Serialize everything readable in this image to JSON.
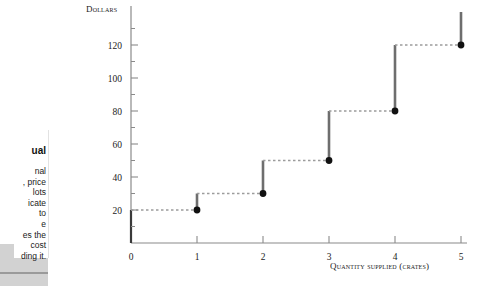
{
  "sidebar": {
    "heading": "ual",
    "lines": [
      "nal",
      ", price",
      "lots",
      "icate",
      "to",
      "e",
      "es the",
      "cost",
      "ding it."
    ]
  },
  "chart_data": {
    "type": "line",
    "title": "",
    "subtitle": "",
    "ylabel": "Dollars",
    "xlabel": "Quantity supplied (crates)",
    "xlim": [
      0,
      5
    ],
    "ylim": [
      0,
      140
    ],
    "grid": false,
    "legend": null,
    "x_ticks": [
      "0",
      "1",
      "2",
      "3",
      "4",
      "5"
    ],
    "x_tick_values": [
      0,
      1,
      2,
      3,
      4,
      5
    ],
    "y_ticks": [
      "20",
      "40",
      "60",
      "80",
      "100",
      "120"
    ],
    "y_tick_values": [
      20,
      40,
      60,
      80,
      100,
      120
    ],
    "y_minor_ticks": [
      10,
      30,
      50,
      70,
      90,
      110,
      130
    ],
    "x": [
      1,
      2,
      3,
      4,
      5
    ],
    "values": [
      20,
      30,
      50,
      80,
      120
    ],
    "series": [
      {
        "name": "Marginal cost / supply",
        "points": [
          {
            "x": 1,
            "y": 20
          },
          {
            "x": 2,
            "y": 30
          },
          {
            "x": 3,
            "y": 50
          },
          {
            "x": 4,
            "y": 80
          },
          {
            "x": 5,
            "y": 120
          }
        ]
      }
    ],
    "steps": [
      {
        "x": 1,
        "dash_from_x": 0,
        "dash_y": 20,
        "riser_top": 30,
        "riser_bottom": 20,
        "dot_y": 20
      },
      {
        "x": 2,
        "dash_from_x": 1,
        "dash_y": 30,
        "riser_top": 50,
        "riser_bottom": 30,
        "dot_y": 30
      },
      {
        "x": 3,
        "dash_from_x": 2,
        "dash_y": 50,
        "riser_top": 80,
        "riser_bottom": 50,
        "dot_y": 50
      },
      {
        "x": 4,
        "dash_from_x": 3,
        "dash_y": 80,
        "riser_top": 120,
        "riser_bottom": 80,
        "dot_y": 80
      },
      {
        "x": 5,
        "dash_from_x": 4,
        "dash_y": 120,
        "riser_top": 140,
        "riser_bottom": 120,
        "dot_y": 120
      }
    ],
    "colors": {
      "axis": "#8a8a8a",
      "riser": "#6e6e6e",
      "dash": "#9c9c9c",
      "dot": "#111111",
      "text": "#1b1b1b"
    }
  }
}
